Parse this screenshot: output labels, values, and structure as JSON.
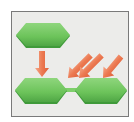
{
  "diagram": {
    "colors": {
      "frame_bg": "#ececea",
      "frame_border": "#7a7a7a",
      "hex_fill": "#6cc35a",
      "hex_top": "#8ed67c",
      "hex_shadow": "#3f9a3a",
      "arrow_fill": "#e8704a",
      "arrow_light": "#f3a487"
    },
    "nodes": [
      {
        "id": "top-hexagon"
      },
      {
        "id": "bottom-left-hexagon"
      },
      {
        "id": "bottom-right-hexagon"
      }
    ],
    "arrows": [
      {
        "id": "down-arrow",
        "direction": "down"
      },
      {
        "id": "diag-arrow-1",
        "direction": "down-left"
      },
      {
        "id": "diag-arrow-2",
        "direction": "down-left"
      },
      {
        "id": "diag-arrow-3",
        "direction": "down-left"
      }
    ],
    "connector": {
      "id": "hex-connector"
    }
  }
}
